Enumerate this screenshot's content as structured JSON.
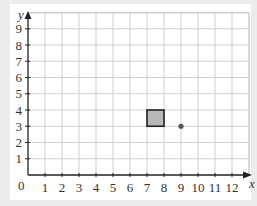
{
  "chart_data": {
    "type": "scatter",
    "title": "",
    "xlabel": "x",
    "ylabel": "y",
    "x_ticks": [
      "1",
      "2",
      "3",
      "4",
      "5",
      "6",
      "7",
      "8",
      "9",
      "10",
      "11",
      "12"
    ],
    "y_ticks": [
      "1",
      "2",
      "3",
      "4",
      "5",
      "6",
      "7",
      "8",
      "9"
    ],
    "origin_label": "0",
    "xlim": [
      0,
      12.4
    ],
    "ylim": [
      0,
      9.8
    ],
    "grid": true,
    "shapes": [
      {
        "type": "square",
        "x0": 7,
        "y0": 3,
        "x1": 8,
        "y1": 4,
        "fill": "#b8b8b8",
        "stroke": "#222222"
      }
    ],
    "points": [
      {
        "x": 9,
        "y": 3,
        "color": "#555555"
      }
    ]
  },
  "labels": {
    "x_axis": "x",
    "y_axis": "y",
    "origin": "0"
  },
  "colors": {
    "grid": "#cfcfcf",
    "axis": "#222222",
    "square_fill": "#b8b8b8",
    "point": "#555555"
  }
}
